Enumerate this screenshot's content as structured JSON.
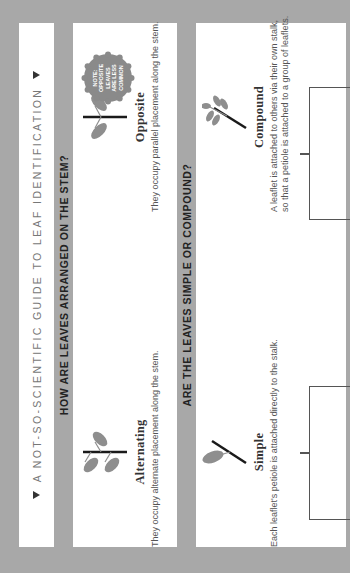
{
  "title": "A Not-So-Scientific Guide to Leaf Identification",
  "sections": [
    {
      "heading": "How are leaves arranged on the stem?",
      "cards": [
        {
          "title": "Alternating",
          "desc": "They occupy alternate placement along the stem.",
          "icon": "alternating-leaves-icon"
        },
        {
          "title": "Opposite",
          "desc": "They occupy parallel placement along the stem.",
          "icon": "opposite-leaves-icon"
        }
      ],
      "note": {
        "line1": "Note:",
        "line2": "Opposite",
        "line3": "leaves",
        "line4": "are less",
        "line5": "common"
      }
    },
    {
      "heading": "Are the leaves simple or compound?",
      "cards": [
        {
          "title": "Simple",
          "desc": "Each leaflet's petiole is attached directly to the stalk.",
          "icon": "simple-leaf-icon"
        },
        {
          "title": "Compound",
          "desc_line1": "A leaflet is attached to others via their own stalk,",
          "desc_line2": "so that a petiole is attached to a group of leaflets.",
          "icon": "compound-leaf-icon"
        }
      ]
    }
  ],
  "colors": {
    "background": "#a8a8a8",
    "panel": "#ffffff",
    "leaf": "#8e8e8e",
    "stem": "#1a1a1a",
    "note_badge": "#8a8a8a"
  }
}
